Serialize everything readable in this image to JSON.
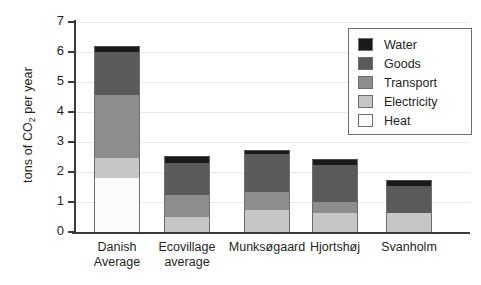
{
  "chart_data": {
    "type": "bar",
    "stacked": true,
    "title": "",
    "xlabel": "",
    "ylabel": "tons of CO2 per year",
    "ylabel_parts": {
      "pre": "tons of CO",
      "sub": "2",
      "post": " per year"
    },
    "ylim": [
      0,
      7
    ],
    "yticks": [
      0,
      1,
      2,
      3,
      4,
      5,
      6,
      7
    ],
    "ytick_labels": [
      "0",
      "1",
      "2",
      "3",
      "4",
      "5",
      "6",
      "7"
    ],
    "grid": true,
    "grid_axis": "y",
    "legend_position": "top-right",
    "categories": [
      "Danish Average",
      "Ecovillage average",
      "Munksøgaard",
      "Hjortshøj",
      "Svanholm"
    ],
    "category_lines": [
      [
        "Danish",
        "Average"
      ],
      [
        "Ecovillage",
        "average"
      ],
      [
        "Munksøgaard",
        ""
      ],
      [
        "Hjortshøj",
        ""
      ],
      [
        "Svanholm",
        ""
      ]
    ],
    "series": [
      {
        "name": "Heat",
        "color": "#fbfbfa",
        "values": [
          1.8,
          0.0,
          0.0,
          0.0,
          0.0
        ]
      },
      {
        "name": "Electricity",
        "color": "#c6c6c6",
        "values": [
          0.67,
          0.5,
          0.75,
          0.65,
          0.65
        ]
      },
      {
        "name": "Transport",
        "color": "#8d8d8d",
        "values": [
          2.1,
          0.75,
          0.6,
          0.35,
          0.0
        ]
      },
      {
        "name": "Goods",
        "color": "#5a5a5a",
        "values": [
          1.43,
          1.05,
          1.25,
          1.25,
          0.9
        ]
      },
      {
        "name": "Water",
        "color": "#1a1a1a",
        "values": [
          0.2,
          0.25,
          0.15,
          0.2,
          0.2
        ]
      }
    ],
    "totals": [
      6.2,
      2.55,
      2.75,
      2.45,
      1.75
    ],
    "legend_order": [
      "Water",
      "Goods",
      "Transport",
      "Electricity",
      "Heat"
    ],
    "legend_entries": [
      {
        "label": "Water",
        "color": "#1a1a1a"
      },
      {
        "label": "Goods",
        "color": "#5a5a5a"
      },
      {
        "label": "Transport",
        "color": "#8d8d8d"
      },
      {
        "label": "Electricity",
        "color": "#c6c6c6"
      },
      {
        "label": "Heat",
        "color": "#fbfbfa"
      }
    ]
  },
  "axis": {
    "line_color": "#3b3b3b",
    "grid_color": "#e8e8ea"
  }
}
